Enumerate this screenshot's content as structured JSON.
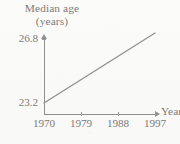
{
  "chart_data": {
    "type": "line",
    "title": "Median age (years)",
    "title_lines": [
      "Median age",
      "(years)"
    ],
    "xlabel": "Year",
    "ylabel": "Median age (years)",
    "x": [
      1970,
      1997
    ],
    "values": [
      23.2,
      26.8
    ],
    "series": [
      {
        "name": "Median age",
        "x": [
          1970,
          1997
        ],
        "values": [
          23.2,
          26.8
        ]
      }
    ],
    "xticks": [
      1970,
      1979,
      1988,
      1997
    ],
    "xtick_labels": [
      "1970",
      "1979",
      "1988",
      "1997"
    ],
    "yticks": [
      23.2,
      26.8
    ],
    "ytick_labels": [
      "23.2",
      "26.8"
    ],
    "xlim": [
      1970,
      1997
    ],
    "ylim": [
      23.2,
      26.8
    ],
    "grid": false,
    "legend": false,
    "line_color": "#4a4a4a",
    "axis_color": "#4a4a4a"
  },
  "axes": {
    "y_axis_name": "",
    "x_axis_name": "Year"
  }
}
